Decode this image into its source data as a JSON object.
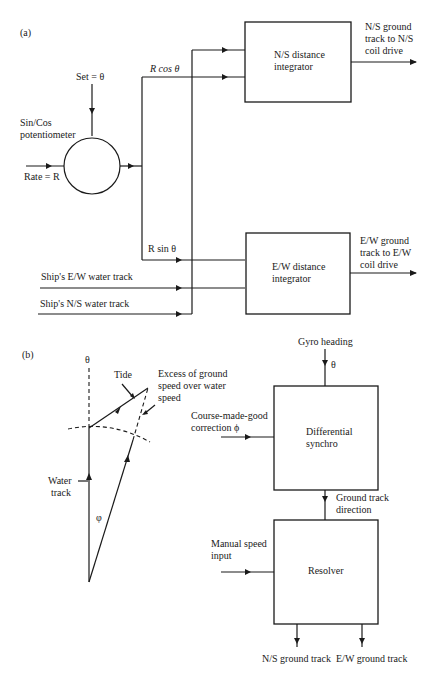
{
  "panel_a": {
    "label": "(a)",
    "set_label": "Set = θ",
    "potentiometer_label_1": "Sin/Cos",
    "potentiometer_label_2": "potentiometer",
    "rate_label": "Rate = R",
    "rcos_label": "R cos θ",
    "rsin_label": "R sin θ",
    "ns_integrator_1": "N/S distance",
    "ns_integrator_2": "integrator",
    "ew_integrator_1": "E/W distance",
    "ew_integrator_2": "integrator",
    "ns_output_1": "N/S ground",
    "ns_output_2": "track to N/S",
    "ns_output_3": "coil drive",
    "ew_output_1": "E/W ground",
    "ew_output_2": "track to E/W",
    "ew_output_3": "coil drive",
    "ew_water_track": "Ship's E/W water track",
    "ns_water_track": "Ship's N/S water track"
  },
  "panel_b": {
    "label": "(b)",
    "theta": "θ",
    "tide": "Tide",
    "excess_1": "Excess of ground",
    "excess_2": "speed over water",
    "excess_3": "speed",
    "water_track_1": "Water",
    "water_track_2": "track",
    "phi": "φ",
    "gyro_heading": "Gyro heading",
    "gyro_theta": "θ",
    "course_1": "Course-made-good",
    "course_2": "correction ϕ",
    "diff_synchro_1": "Differential",
    "diff_synchro_2": "synchro",
    "ground_track_1": "Ground track",
    "ground_track_2": "direction",
    "manual_speed_1": "Manual speed",
    "manual_speed_2": "input",
    "resolver": "Resolver",
    "ns_ground_track": "N/S ground track",
    "ew_ground_track": "E/W ground track"
  }
}
